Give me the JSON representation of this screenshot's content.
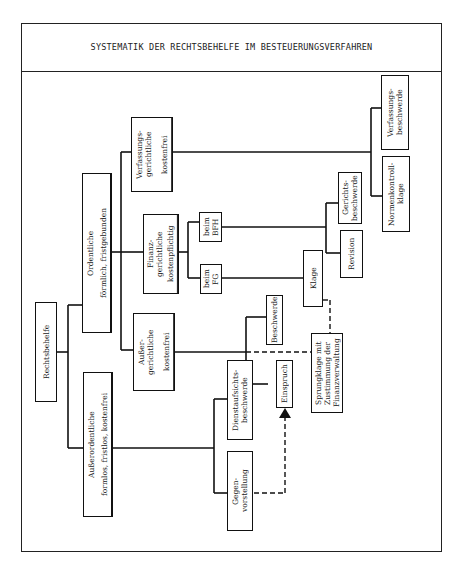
{
  "title": "SYSTEMATIK DER RECHTSBEHELFE IM BESTEUERUNGSVERFAHREN",
  "nodes": {
    "root": "Rechtsbehelfe",
    "ordentliche": {
      "title": "Ordentliche",
      "subtitle": "förmlich, fristgebunden"
    },
    "ausserordentliche": {
      "title": "Außerordentliche",
      "subtitle": "formlos, fristlos, kostenfrei"
    },
    "verfassungsgerichtliche": {
      "title": "Verfassungs-\ngerichtliche",
      "subtitle": "kostenfrei"
    },
    "finanzgerichtliche": {
      "title": "Finanz-\ngerichtliche",
      "subtitle": "kostenpflichtig"
    },
    "aussergerichtliche": {
      "title": "Außer-\ngerichtliche",
      "subtitle": "kostenfrei"
    },
    "beim_bfh": "beim\nBFH",
    "beim_fg": "beim\nFG",
    "verfassungsbeschwerde": "Verfassungs-\nbeschwerde",
    "normenkontrollklage": "Normenkontroll-\nklage",
    "gerichtsbeschwerde": "Gerichts-\nbeschwerde",
    "revision": "Revision",
    "klage": "Klage",
    "beschwerde": "Beschwerde",
    "einspruch": "Einspruch",
    "sprungklage": "Sprungklage mit\nZustimmung der\nFinanzverwaltung",
    "dienstaufsichtsbeschwerde": "Dienstaufsichts-\nbeschwerde",
    "gegenvorstellung": "Gegen-\nvorstellung"
  }
}
